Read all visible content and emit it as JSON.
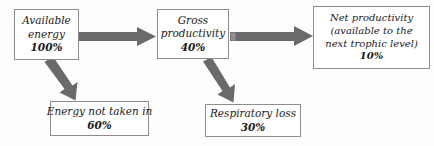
{
  "diagram": {
    "background_color": "#fdfdfd",
    "box_border_color": "#8d8d8d",
    "arrow_color": "#6a6a6a",
    "text_color": "#1b1b1b",
    "nodes": [
      {
        "id": "available-energy",
        "lines": [
          "Available",
          "energy"
        ],
        "line1": "Available",
        "line2": "energy",
        "value": "100%"
      },
      {
        "id": "gross-productivity",
        "lines": [
          "Gross",
          "productivity"
        ],
        "line1": "Gross",
        "line2": "productivity",
        "value": "40%"
      },
      {
        "id": "net-productivity",
        "lines": [
          "Net productivity",
          "(available to the",
          "next trophic level)"
        ],
        "line1": "Net productivity",
        "line2": "(available to the",
        "line3": "next trophic level)",
        "value": "10%"
      },
      {
        "id": "energy-not-taken-in",
        "lines": [
          "Energy not taken in"
        ],
        "line1": "Energy not taken in",
        "value": "60%"
      },
      {
        "id": "respiratory-loss",
        "lines": [
          "Respiratory loss"
        ],
        "line1": "Respiratory loss",
        "value": "30%"
      }
    ],
    "arrows": [
      {
        "id": "arrow-available-to-gross",
        "from": "available-energy",
        "to": "gross-productivity",
        "direction": "right"
      },
      {
        "id": "arrow-gross-to-net",
        "from": "gross-productivity",
        "to": "net-productivity",
        "direction": "right"
      },
      {
        "id": "arrow-available-to-nottaken",
        "from": "available-energy",
        "to": "energy-not-taken-in",
        "direction": "down-right"
      },
      {
        "id": "arrow-gross-to-respiratory",
        "from": "gross-productivity",
        "to": "respiratory-loss",
        "direction": "down-right"
      }
    ]
  }
}
